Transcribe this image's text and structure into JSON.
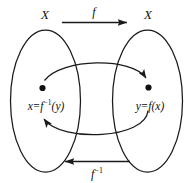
{
  "diagram": {
    "stroke_color": "#1a1a1a",
    "background_color": "#ffffff",
    "sets": [
      {
        "id": "domain",
        "label": "X"
      },
      {
        "id": "codomain",
        "label": "X"
      }
    ],
    "points": [
      {
        "id": "x-point",
        "label_prefix": "x",
        "equals": "=",
        "label_fn": "f",
        "label_exp": "−1",
        "label_arg": "(y)"
      },
      {
        "id": "y-point",
        "label_prefix": "y",
        "equals": "=",
        "label_fn": "f",
        "label_exp": "",
        "label_arg": "(x)"
      }
    ],
    "arrows": [
      {
        "id": "forward-map",
        "label": "f",
        "exponent": "",
        "direction": "right"
      },
      {
        "id": "inverse-map",
        "label": "f",
        "exponent": "−1",
        "direction": "left"
      }
    ],
    "curved_arrows": [
      {
        "id": "forward-curve",
        "direction": "left-to-right"
      },
      {
        "id": "inverse-curve",
        "direction": "right-to-left"
      }
    ]
  }
}
